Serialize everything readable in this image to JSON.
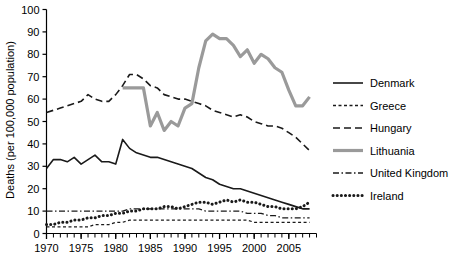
{
  "chart_data": {
    "type": "line",
    "title": "",
    "xlabel": "",
    "ylabel": "Deaths (per 100,000 population)",
    "xlim": [
      1970,
      2009
    ],
    "ylim": [
      0,
      100
    ],
    "ytick_step": 10,
    "yticks": [
      "0",
      "10",
      "20",
      "30",
      "40",
      "50",
      "60",
      "70",
      "80",
      "90",
      "100"
    ],
    "xticks_major": [
      "1970",
      "1975",
      "1980",
      "1985",
      "1990",
      "1995",
      "2000",
      "2005"
    ],
    "xtick_minor_step": 1,
    "grid": false,
    "legend_position": "right",
    "series": [
      {
        "name": "Denmark",
        "style": "solid",
        "color": "#1a1a1a",
        "width": 1.6,
        "x": [
          1970,
          1971,
          1972,
          1973,
          1974,
          1975,
          1976,
          1977,
          1978,
          1979,
          1980,
          1981,
          1982,
          1983,
          1984,
          1985,
          1986,
          1987,
          1988,
          1989,
          1990,
          1991,
          1992,
          1993,
          1994,
          1995,
          1996,
          1997,
          1998,
          1999,
          2000,
          2001,
          2002,
          2003,
          2004,
          2005,
          2006,
          2007,
          2008
        ],
        "values": [
          29,
          33,
          33,
          32,
          34,
          31,
          33,
          35,
          32,
          32,
          31,
          42,
          38,
          36,
          35,
          34,
          34,
          33,
          32,
          31,
          30,
          29,
          27,
          25,
          24,
          22,
          21,
          20,
          20,
          19,
          18,
          17,
          16,
          15,
          14,
          13,
          12,
          11,
          11
        ]
      },
      {
        "name": "Greece",
        "style": "fine-dashed",
        "color": "#1a1a1a",
        "width": 1.3,
        "x": [
          1970,
          1971,
          1972,
          1973,
          1974,
          1975,
          1976,
          1977,
          1978,
          1979,
          1980,
          1981,
          1982,
          1983,
          1984,
          1985,
          1986,
          1987,
          1988,
          1989,
          1990,
          1991,
          1992,
          1993,
          1994,
          1995,
          1996,
          1997,
          1998,
          1999,
          2000,
          2001,
          2002,
          2003,
          2004,
          2005,
          2006,
          2007,
          2008
        ],
        "values": [
          3,
          3,
          3,
          3,
          3,
          3,
          3,
          4,
          4,
          4,
          5,
          5,
          6,
          6,
          6,
          6,
          6,
          6,
          6,
          6,
          6,
          6,
          6,
          6,
          6,
          6,
          6,
          6,
          6,
          6,
          5,
          5,
          5,
          5,
          5,
          5,
          5,
          5,
          5
        ]
      },
      {
        "name": "Hungary",
        "style": "dashed",
        "color": "#1a1a1a",
        "width": 1.6,
        "x": [
          1970,
          1971,
          1972,
          1973,
          1974,
          1975,
          1976,
          1977,
          1978,
          1979,
          1980,
          1981,
          1982,
          1983,
          1984,
          1985,
          1986,
          1987,
          1988,
          1989,
          1990,
          1991,
          1992,
          1993,
          1994,
          1995,
          1996,
          1997,
          1998,
          1999,
          2000,
          2001,
          2002,
          2003,
          2004,
          2005,
          2006,
          2007,
          2008
        ],
        "values": [
          54,
          55,
          56,
          57,
          58,
          59,
          62,
          60,
          59,
          59,
          62,
          66,
          71,
          71,
          69,
          66,
          65,
          62,
          61,
          60,
          60,
          59,
          58,
          57,
          55,
          54,
          53,
          52,
          53,
          52,
          50,
          49,
          48,
          48,
          47,
          45,
          43,
          40,
          37
        ]
      },
      {
        "name": "Lithuania",
        "style": "solid",
        "color": "#9a9a9a",
        "width": 3.2,
        "x": [
          1981,
          1982,
          1983,
          1984,
          1985,
          1986,
          1987,
          1988,
          1989,
          1990,
          1991,
          1992,
          1993,
          1994,
          1995,
          1996,
          1997,
          1998,
          1999,
          2000,
          2001,
          2002,
          2003,
          2004,
          2005,
          2006,
          2007,
          2008
        ],
        "values": [
          65,
          65,
          65,
          65,
          48,
          54,
          46,
          50,
          48,
          56,
          58,
          74,
          86,
          89,
          87,
          87,
          84,
          79,
          82,
          76,
          80,
          78,
          74,
          72,
          64,
          57,
          57,
          61
        ]
      },
      {
        "name": "United Kingdom",
        "style": "dash-dot",
        "color": "#1a1a1a",
        "width": 1.3,
        "x": [
          1970,
          1971,
          1972,
          1973,
          1974,
          1975,
          1976,
          1977,
          1978,
          1979,
          1980,
          1981,
          1982,
          1983,
          1984,
          1985,
          1986,
          1987,
          1988,
          1989,
          1990,
          1991,
          1992,
          1993,
          1994,
          1995,
          1996,
          1997,
          1998,
          1999,
          2000,
          2001,
          2002,
          2003,
          2004,
          2005,
          2006,
          2007,
          2008
        ],
        "values": [
          10,
          10,
          10,
          10,
          10,
          10,
          10,
          10,
          10,
          10,
          10,
          10,
          11,
          11,
          11,
          11,
          11,
          11,
          11,
          11,
          11,
          11,
          11,
          10,
          10,
          10,
          10,
          10,
          10,
          9,
          9,
          9,
          8,
          8,
          7,
          7,
          7,
          7,
          7
        ]
      },
      {
        "name": "Ireland",
        "style": "dotted",
        "color": "#1a1a1a",
        "width": 3.0,
        "x": [
          1970,
          1971,
          1972,
          1973,
          1974,
          1975,
          1976,
          1977,
          1978,
          1979,
          1980,
          1981,
          1982,
          1983,
          1984,
          1985,
          1986,
          1987,
          1988,
          1989,
          1990,
          1991,
          1992,
          1993,
          1994,
          1995,
          1996,
          1997,
          1998,
          1999,
          2000,
          2001,
          2002,
          2003,
          2004,
          2005,
          2006,
          2007,
          2008
        ],
        "values": [
          4,
          4,
          5,
          5,
          6,
          6,
          7,
          7,
          8,
          8,
          9,
          9,
          10,
          10,
          11,
          11,
          11,
          12,
          12,
          11,
          12,
          13,
          14,
          14,
          13,
          14,
          15,
          14,
          15,
          14,
          14,
          13,
          12,
          12,
          11,
          11,
          11,
          12,
          14
        ]
      }
    ],
    "legend": [
      {
        "label": "Denmark",
        "style": "solid",
        "color": "#1a1a1a",
        "width": 1.6
      },
      {
        "label": "Greece",
        "style": "fine-dashed",
        "color": "#1a1a1a",
        "width": 1.3
      },
      {
        "label": "Hungary",
        "style": "dashed",
        "color": "#1a1a1a",
        "width": 1.6
      },
      {
        "label": "Lithuania",
        "style": "solid",
        "color": "#9a9a9a",
        "width": 3.2
      },
      {
        "label": "United Kingdom",
        "style": "dash-dot",
        "color": "#1a1a1a",
        "width": 1.3
      },
      {
        "label": "Ireland",
        "style": "dotted",
        "color": "#1a1a1a",
        "width": 3.0
      }
    ]
  }
}
